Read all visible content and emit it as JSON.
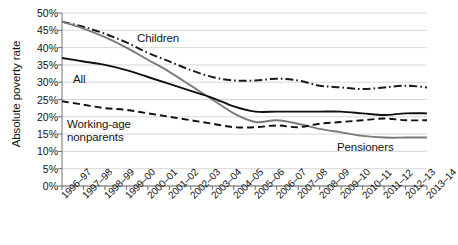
{
  "chart_data": {
    "type": "line",
    "title": "",
    "xlabel": "",
    "ylabel": "Absolute poverty rate",
    "ylim": [
      0,
      50
    ],
    "ytick_labels": [
      "50%",
      "45%",
      "40%",
      "35%",
      "30%",
      "25%",
      "20%",
      "15%",
      "10%",
      "5%",
      "0%"
    ],
    "ytick_values": [
      50,
      45,
      40,
      35,
      30,
      25,
      20,
      15,
      10,
      5,
      0
    ],
    "grid": true,
    "legend_position": "inline-annotations",
    "categories": [
      "1996–97",
      "1997–98",
      "1998–99",
      "1999–00",
      "2000–01",
      "2001–02",
      "2002–03",
      "2003–04",
      "2004–05",
      "2005–06",
      "2006–07",
      "2007–08",
      "2008–09",
      "2009–10",
      "2010–11",
      "2011–12",
      "2012–13",
      "2013–14"
    ],
    "series": [
      {
        "name": "Children",
        "style": "dash-dot",
        "color": "#1a1a1a",
        "values": [
          47.5,
          46.0,
          44.0,
          41.5,
          38.5,
          36.0,
          33.5,
          31.5,
          30.5,
          30.5,
          31.0,
          30.5,
          29.0,
          28.5,
          28.0,
          28.5,
          29.0,
          28.5
        ]
      },
      {
        "name": "Pensioners",
        "style": "solid",
        "color": "#7a7a7a",
        "values": [
          47.5,
          45.5,
          43.0,
          40.0,
          36.5,
          33.0,
          29.0,
          25.0,
          21.0,
          18.5,
          19.0,
          18.0,
          16.5,
          15.5,
          14.5,
          14.0,
          14.0,
          14.0
        ]
      },
      {
        "name": "All",
        "style": "solid",
        "color": "#101010",
        "values": [
          37.0,
          36.0,
          35.0,
          33.5,
          31.5,
          29.5,
          27.5,
          25.5,
          23.0,
          21.5,
          21.5,
          21.5,
          21.5,
          21.5,
          21.0,
          20.5,
          21.0,
          21.0
        ]
      },
      {
        "name": "Working-age nonparents",
        "style": "dashed",
        "color": "#101010",
        "values": [
          24.5,
          23.5,
          22.5,
          22.0,
          21.0,
          20.0,
          19.0,
          18.0,
          17.0,
          17.0,
          17.5,
          17.0,
          18.0,
          18.5,
          19.0,
          19.5,
          19.0,
          19.0
        ]
      }
    ],
    "annotations": [
      {
        "text": "Children",
        "series": "Children"
      },
      {
        "text": "All",
        "series": "All"
      },
      {
        "text": "Working-age\nnonparents",
        "series": "Working-age nonparents"
      },
      {
        "text": "Pensioners",
        "series": "Pensioners"
      }
    ]
  },
  "labels": {
    "axis_title": "Absolute poverty rate",
    "children": "Children",
    "all": "All",
    "working_line1": "Working-age",
    "working_line2": "nonparents",
    "pensioners": "Pensioners"
  }
}
